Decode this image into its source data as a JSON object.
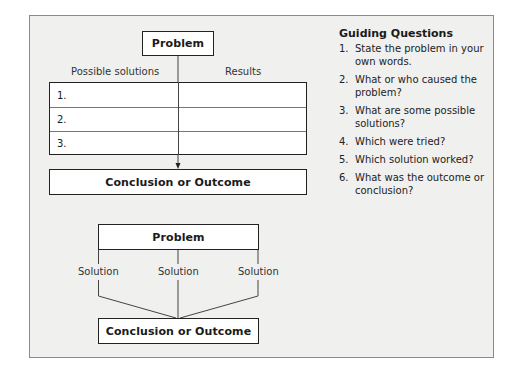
{
  "diagram1": {
    "problem_label": "Problem",
    "col_left": "Possible solutions",
    "col_right": "Results",
    "rows": [
      "1.",
      "2.",
      "3."
    ],
    "conclusion_label": "Conclusion or Outcome"
  },
  "diagram2": {
    "problem_label": "Problem",
    "solutions": [
      "Solution",
      "Solution",
      "Solution"
    ],
    "conclusion_label": "Conclusion or Outcome"
  },
  "guiding": {
    "title": "Guiding Questions",
    "items": [
      {
        "num": "1.",
        "text": "State the problem in your own words."
      },
      {
        "num": "2.",
        "text": "What or who caused the problem?"
      },
      {
        "num": "3.",
        "text": "What are some possible solutions?"
      },
      {
        "num": "4.",
        "text": "Which were tried?"
      },
      {
        "num": "5.",
        "text": "Which solution worked?"
      },
      {
        "num": "6.",
        "text": "What was the outcome or conclusion?"
      }
    ]
  }
}
